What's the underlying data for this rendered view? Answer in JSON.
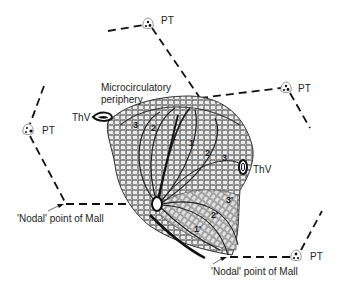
{
  "diagram": {
    "colors": {
      "line": "#111111",
      "tissue_fill": "#e6e6e6",
      "tissue_stroke": "#333333",
      "text": "#222222",
      "background": "#ffffff"
    },
    "labels": {
      "microcirculatory_line1": "Microcirculatory",
      "microcirculatory_line2": "periphery",
      "thv_left": "ThV",
      "thv_right": "ThV",
      "pt_top": "PT",
      "pt_right": "PT",
      "pt_left": "PT",
      "pt_bottom_right": "PT",
      "nodal_left": "'Nodal' point of Mall",
      "nodal_bottom": "'Nodal' point of Mall"
    },
    "zones": {
      "upper": [
        "3",
        "2",
        "1",
        "1",
        "2",
        "3"
      ],
      "lower": [
        "1'",
        "2'",
        "3'"
      ]
    },
    "nodes": [
      {
        "name": "PT",
        "x": 148,
        "y": 22
      },
      {
        "name": "PT",
        "x": 286,
        "y": 87
      },
      {
        "name": "PT",
        "x": 26,
        "y": 130
      },
      {
        "name": "PT",
        "x": 296,
        "y": 254
      },
      {
        "name": "ThV",
        "x": 100,
        "y": 117
      },
      {
        "name": "ThV",
        "x": 243,
        "y": 168
      },
      {
        "name": "Nodal point",
        "x": 66,
        "y": 204
      },
      {
        "name": "Nodal point",
        "x": 230,
        "y": 257
      }
    ]
  }
}
